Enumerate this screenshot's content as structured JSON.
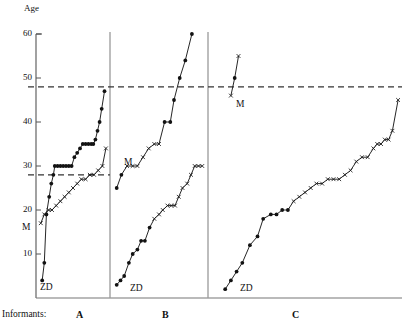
{
  "figure": {
    "axis_title": "Age",
    "informants_label": "Informants:",
    "y_ticks": [
      {
        "value": 60,
        "label": "60"
      },
      {
        "value": 50,
        "label": "50"
      },
      {
        "value": 40,
        "label": "40"
      },
      {
        "value": 30,
        "label": "30"
      },
      {
        "value": 20,
        "label": "20"
      },
      {
        "value": 10,
        "label": "10"
      }
    ],
    "panels": [
      {
        "id": "A",
        "label": "A"
      },
      {
        "id": "B",
        "label": "B"
      },
      {
        "id": "C",
        "label": "C"
      }
    ],
    "series_labels": {
      "m": "M",
      "zd": "ZD"
    }
  },
  "chart_data": {
    "type": "line",
    "title": "",
    "xlabel": "Informants:",
    "ylabel": "Age",
    "ylim": [
      0,
      60
    ],
    "grid": false,
    "legend_position": "inline-labels",
    "axis_ticks": [
      10,
      20,
      30,
      40,
      50,
      60
    ],
    "panels": [
      {
        "panel": "A",
        "reference_line": 28,
        "series": [
          {
            "name": "ZD",
            "marker": "filled-circle",
            "label": "ZD",
            "points": [
              {
                "x": 0.06,
                "y": 4
              },
              {
                "x": 0.09,
                "y": 8
              },
              {
                "x": 0.12,
                "y": 19
              },
              {
                "x": 0.16,
                "y": 23
              },
              {
                "x": 0.19,
                "y": 26
              },
              {
                "x": 0.22,
                "y": 28
              },
              {
                "x": 0.24,
                "y": 30
              },
              {
                "x": 0.28,
                "y": 30
              },
              {
                "x": 0.32,
                "y": 30
              },
              {
                "x": 0.36,
                "y": 30
              },
              {
                "x": 0.4,
                "y": 30
              },
              {
                "x": 0.44,
                "y": 30
              },
              {
                "x": 0.48,
                "y": 30
              },
              {
                "x": 0.52,
                "y": 32
              },
              {
                "x": 0.56,
                "y": 33
              },
              {
                "x": 0.6,
                "y": 34
              },
              {
                "x": 0.64,
                "y": 35
              },
              {
                "x": 0.68,
                "y": 35
              },
              {
                "x": 0.72,
                "y": 35
              },
              {
                "x": 0.76,
                "y": 35
              },
              {
                "x": 0.79,
                "y": 35
              },
              {
                "x": 0.82,
                "y": 36
              },
              {
                "x": 0.85,
                "y": 38
              },
              {
                "x": 0.88,
                "y": 40
              },
              {
                "x": 0.91,
                "y": 43
              },
              {
                "x": 0.95,
                "y": 47
              }
            ]
          },
          {
            "name": "M",
            "marker": "cross",
            "label": "M",
            "points": [
              {
                "x": 0.04,
                "y": 17
              },
              {
                "x": 0.09,
                "y": 19
              },
              {
                "x": 0.15,
                "y": 20
              },
              {
                "x": 0.2,
                "y": 20
              },
              {
                "x": 0.26,
                "y": 21
              },
              {
                "x": 0.32,
                "y": 22
              },
              {
                "x": 0.38,
                "y": 23
              },
              {
                "x": 0.44,
                "y": 24
              },
              {
                "x": 0.5,
                "y": 25
              },
              {
                "x": 0.56,
                "y": 26
              },
              {
                "x": 0.62,
                "y": 27
              },
              {
                "x": 0.68,
                "y": 27
              },
              {
                "x": 0.74,
                "y": 28
              },
              {
                "x": 0.8,
                "y": 28
              },
              {
                "x": 0.86,
                "y": 29
              },
              {
                "x": 0.92,
                "y": 30
              },
              {
                "x": 0.97,
                "y": 34
              }
            ]
          }
        ]
      },
      {
        "panel": "B",
        "reference_line": null,
        "series": [
          {
            "name": "M",
            "marker": "mixed",
            "label": "M",
            "points": [
              {
                "x": 0.05,
                "y": 25
              },
              {
                "x": 0.1,
                "y": 28
              },
              {
                "x": 0.16,
                "y": 30
              },
              {
                "x": 0.22,
                "y": 30
              },
              {
                "x": 0.27,
                "y": 30
              },
              {
                "x": 0.33,
                "y": 32
              },
              {
                "x": 0.39,
                "y": 34
              },
              {
                "x": 0.45,
                "y": 35
              },
              {
                "x": 0.5,
                "y": 35
              },
              {
                "x": 0.56,
                "y": 40
              },
              {
                "x": 0.62,
                "y": 40
              },
              {
                "x": 0.66,
                "y": 45
              },
              {
                "x": 0.72,
                "y": 50
              },
              {
                "x": 0.78,
                "y": 54
              },
              {
                "x": 0.85,
                "y": 60
              }
            ]
          },
          {
            "name": "ZD",
            "marker": "mixed",
            "label": "ZD",
            "points": [
              {
                "x": 0.05,
                "y": 3
              },
              {
                "x": 0.09,
                "y": 4
              },
              {
                "x": 0.13,
                "y": 5
              },
              {
                "x": 0.18,
                "y": 8
              },
              {
                "x": 0.22,
                "y": 10
              },
              {
                "x": 0.27,
                "y": 11
              },
              {
                "x": 0.31,
                "y": 13
              },
              {
                "x": 0.35,
                "y": 13
              },
              {
                "x": 0.4,
                "y": 16
              },
              {
                "x": 0.45,
                "y": 18
              },
              {
                "x": 0.5,
                "y": 19
              },
              {
                "x": 0.54,
                "y": 20
              },
              {
                "x": 0.59,
                "y": 21
              },
              {
                "x": 0.63,
                "y": 21
              },
              {
                "x": 0.67,
                "y": 21
              },
              {
                "x": 0.71,
                "y": 23
              },
              {
                "x": 0.75,
                "y": 25
              },
              {
                "x": 0.8,
                "y": 26
              },
              {
                "x": 0.84,
                "y": 28
              },
              {
                "x": 0.88,
                "y": 30
              },
              {
                "x": 0.92,
                "y": 30
              },
              {
                "x": 0.96,
                "y": 30
              }
            ]
          }
        ]
      },
      {
        "panel": "C",
        "reference_line": 48,
        "series": [
          {
            "name": "M",
            "marker": "mixed",
            "label": "M",
            "points": [
              {
                "x": 0.11,
                "y": 46
              },
              {
                "x": 0.13,
                "y": 50
              },
              {
                "x": 0.15,
                "y": 55
              }
            ]
          },
          {
            "name": "ZD",
            "marker": "mixed",
            "label": "ZD",
            "points": [
              {
                "x": 0.08,
                "y": 2
              },
              {
                "x": 0.11,
                "y": 4
              },
              {
                "x": 0.14,
                "y": 6
              },
              {
                "x": 0.17,
                "y": 8
              },
              {
                "x": 0.21,
                "y": 12
              },
              {
                "x": 0.25,
                "y": 14
              },
              {
                "x": 0.28,
                "y": 18
              },
              {
                "x": 0.32,
                "y": 19
              },
              {
                "x": 0.35,
                "y": 19
              },
              {
                "x": 0.38,
                "y": 20
              },
              {
                "x": 0.41,
                "y": 20
              },
              {
                "x": 0.44,
                "y": 22
              },
              {
                "x": 0.47,
                "y": 23
              },
              {
                "x": 0.5,
                "y": 24
              },
              {
                "x": 0.53,
                "y": 25
              },
              {
                "x": 0.56,
                "y": 26
              },
              {
                "x": 0.59,
                "y": 26
              },
              {
                "x": 0.62,
                "y": 27
              },
              {
                "x": 0.65,
                "y": 27
              },
              {
                "x": 0.68,
                "y": 27
              },
              {
                "x": 0.71,
                "y": 28
              },
              {
                "x": 0.74,
                "y": 29
              },
              {
                "x": 0.77,
                "y": 31
              },
              {
                "x": 0.8,
                "y": 32
              },
              {
                "x": 0.83,
                "y": 32
              },
              {
                "x": 0.86,
                "y": 34
              },
              {
                "x": 0.88,
                "y": 35
              },
              {
                "x": 0.9,
                "y": 35
              },
              {
                "x": 0.92,
                "y": 36
              },
              {
                "x": 0.94,
                "y": 36
              },
              {
                "x": 0.96,
                "y": 38
              },
              {
                "x": 0.99,
                "y": 45
              }
            ]
          }
        ]
      }
    ]
  }
}
